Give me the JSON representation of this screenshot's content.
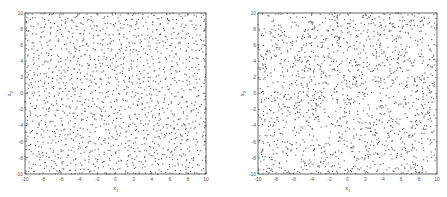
{
  "chart_data": [
    {
      "type": "scatter",
      "title": "",
      "xlabel": "x1",
      "ylabel": "x2",
      "xlim": [
        -10,
        10
      ],
      "ylim": [
        -10,
        10
      ],
      "xticks": [
        -10,
        -8,
        -6,
        -4,
        -2,
        0,
        2,
        4,
        6,
        8,
        10
      ],
      "yticks": [
        -10,
        -8,
        -6,
        -4,
        -2,
        0,
        2,
        4,
        6,
        8,
        10
      ],
      "grid": false,
      "legend": null,
      "description": "Evenly spread quasi-uniform (low-discrepancy / blue-noise) point set filling the square [-10,10]x[-10,10]",
      "n_points_approx": 1500,
      "marker_color": "#555555",
      "box": {
        "x": 25,
        "y": 13,
        "w": 181,
        "h": 161
      },
      "distribution": "uniform-even"
    },
    {
      "type": "scatter",
      "title": "",
      "xlabel": "x1",
      "ylabel": "x2",
      "xlim": [
        -10,
        10
      ],
      "ylim": [
        -10,
        10
      ],
      "xticks": [
        -10,
        -8,
        -6,
        -4,
        -2,
        0,
        2,
        4,
        6,
        8,
        10
      ],
      "yticks": [
        -10,
        -8,
        -6,
        -4,
        -2,
        0,
        2,
        4,
        6,
        8,
        10
      ],
      "grid": false,
      "legend": null,
      "description": "Pseudo-random uniform point set with visible clusters and gaps in the square [-10,10]x[-10,10]",
      "n_points_approx": 1500,
      "marker_color": "#555555",
      "box": {
        "x": 258,
        "y": 13,
        "w": 179,
        "h": 161
      },
      "distribution": "random"
    }
  ],
  "labels": {
    "x_main": "x",
    "x_sub": "1",
    "y_main": "x",
    "y_sub": "2"
  }
}
